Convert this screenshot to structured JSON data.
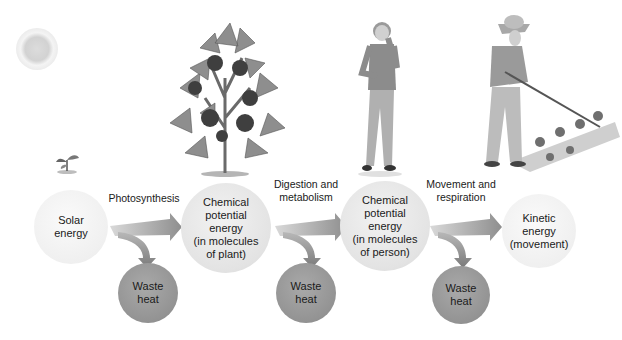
{
  "diagram": {
    "nodes": [
      {
        "id": "solar",
        "label": "Solar\nenergy"
      },
      {
        "id": "plant",
        "label": "Chemical\npotential\nenergy\n(in molecules\nof plant)"
      },
      {
        "id": "person",
        "label": "Chemical\npotential\nenergy\n(in molecules\nof person)"
      },
      {
        "id": "kinetic",
        "label": "Kinetic\nenergy\n(movement)"
      }
    ],
    "waste": [
      {
        "label": "Waste\nheat"
      },
      {
        "label": "Waste\nheat"
      },
      {
        "label": "Waste\nheat"
      }
    ],
    "processes": [
      {
        "label": "Photosynthesis"
      },
      {
        "label": "Digestion and\nmetabolism"
      },
      {
        "label": "Movement and\nrespiration"
      }
    ],
    "illustrations": [
      {
        "name": "sun"
      },
      {
        "name": "seedling"
      },
      {
        "name": "pepper plant"
      },
      {
        "name": "person eating"
      },
      {
        "name": "person hoeing garden"
      }
    ],
    "colors": {
      "node_light": "#e6e6e6",
      "waste_dark": "#959595",
      "arrow": "#9a9a9a"
    }
  }
}
